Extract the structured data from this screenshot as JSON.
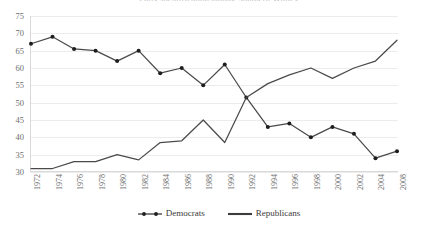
{
  "chart_data": {
    "type": "line",
    "title": "Party Identification among Southern Whites",
    "xlabel": "",
    "ylabel": "",
    "ylim": [
      30,
      75
    ],
    "ytick_step": 5,
    "yticks": [
      75,
      70,
      65,
      60,
      55,
      50,
      45,
      40,
      35,
      30
    ],
    "grid": true,
    "legend_position": "bottom-center",
    "x": [
      "1972",
      "1974",
      "1976",
      "1978",
      "1980",
      "1982",
      "1984",
      "1986",
      "1988",
      "1990",
      "1992",
      "1994",
      "1996",
      "1998",
      "2000",
      "2002",
      "2004",
      "2008"
    ],
    "categories": [
      "1972",
      "1974",
      "1976",
      "1978",
      "1980",
      "1982",
      "1984",
      "1986",
      "1988",
      "1990",
      "1992",
      "1994",
      "1996",
      "1998",
      "2000",
      "2002",
      "2004",
      "2008"
    ],
    "series": [
      {
        "name": "Democrats",
        "color": "#3c3c3c",
        "marker": "filled-circle",
        "values": [
          67,
          69,
          65.5,
          65,
          62,
          65,
          58.5,
          60,
          55,
          61,
          51.5,
          43,
          44,
          40,
          43,
          41,
          34,
          36
        ]
      },
      {
        "name": "Republicans",
        "color": "#4a4a4a",
        "marker": "none",
        "values": [
          31,
          31,
          33,
          33,
          35,
          33.5,
          38.5,
          39,
          45,
          38.5,
          51.5,
          55.5,
          58,
          60,
          57,
          60,
          62,
          68
        ]
      }
    ],
    "annotations": []
  },
  "legend": {
    "items": [
      {
        "label": "Democrats"
      },
      {
        "label": "Republicans"
      }
    ]
  },
  "axes": {
    "y_tick_labels": [
      "75",
      "70",
      "65",
      "60",
      "55",
      "50",
      "45",
      "40",
      "35",
      "30"
    ],
    "x_tick_labels": [
      "1972",
      "1974",
      "1976",
      "1978",
      "1980",
      "1982",
      "1984",
      "1986",
      "1988",
      "1990",
      "1992",
      "1994",
      "1996",
      "1998",
      "2000",
      "2002",
      "2004",
      "2008"
    ]
  }
}
